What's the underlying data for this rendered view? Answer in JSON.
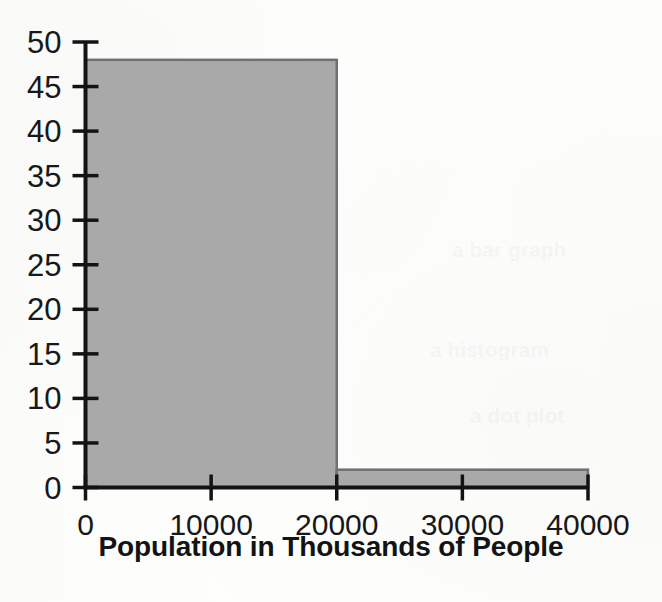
{
  "chart_data": {
    "type": "bar",
    "chart_subtype": "histogram",
    "title": "",
    "subtitle": "",
    "xlabel": "Population in Thousands of People",
    "ylabel": "",
    "categories": [
      "0-20000",
      "20000-40000"
    ],
    "bin_edges": [
      0,
      20000,
      40000
    ],
    "values": [
      48,
      2
    ],
    "series": [
      {
        "name": "Frequency",
        "values": [
          48,
          2
        ]
      }
    ],
    "bars": [
      {
        "bin_start": 0,
        "bin_end": 20000,
        "value": 48
      },
      {
        "bin_start": 20000,
        "bin_end": 40000,
        "value": 2
      }
    ],
    "xlim": [
      0,
      40000
    ],
    "ylim": [
      0,
      50
    ],
    "xticks": [
      0,
      10000,
      20000,
      30000,
      40000
    ],
    "yticks": [
      0,
      5,
      10,
      15,
      20,
      25,
      30,
      35,
      40,
      45,
      50
    ],
    "xtick_labels": [
      "0",
      "10000",
      "20000",
      "30000",
      "40000"
    ],
    "ytick_labels": [
      "0",
      "5",
      "10",
      "15",
      "20",
      "25",
      "30",
      "35",
      "40",
      "45",
      "50"
    ],
    "grid": false,
    "legend": false,
    "legend_position": "none"
  },
  "style": {
    "bar_fill": "#a9a9a9",
    "bar_stroke": "#6f7073",
    "axis_color": "#111315",
    "tick_label_color": "#16181a",
    "axis_title_color": "#111315",
    "background": "#fdfdfc"
  },
  "bleed_through": {
    "note": "faint show-through marks from the opposite side of the scanned page",
    "fragments": [
      {
        "text": "a bar graph",
        "x": 452,
        "y": 238
      },
      {
        "text": "a histogram",
        "x": 430,
        "y": 338
      },
      {
        "text": "a dot plot",
        "x": 470,
        "y": 404
      }
    ]
  }
}
